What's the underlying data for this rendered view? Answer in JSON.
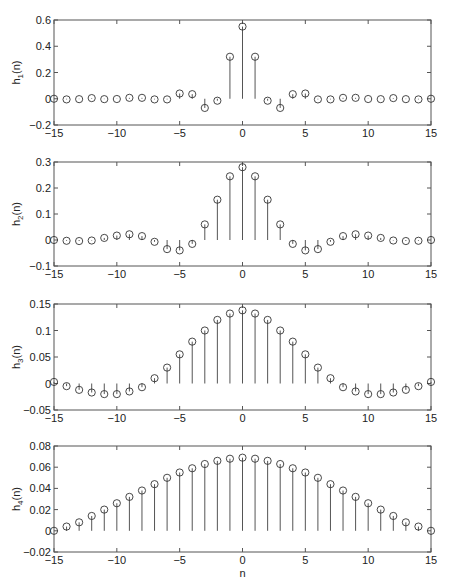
{
  "chart_data": [
    {
      "type": "stem",
      "ylabel": "h_1(n)",
      "ylabel_main": "h",
      "ylabel_sub": "1",
      "ylabel_tail": "(n)",
      "xlabel": "",
      "xlim": [
        -15,
        15
      ],
      "ylim": [
        -0.2,
        0.6
      ],
      "xticks": [
        -15,
        -10,
        -5,
        0,
        5,
        10,
        15
      ],
      "xtick_labels": [
        "−15",
        "−10",
        "−5",
        "0",
        "5",
        "10",
        "15"
      ],
      "yticks": [
        -0.2,
        0,
        0.2,
        0.4,
        0.6
      ],
      "ytick_labels": [
        "−0.2",
        "0",
        "0.2",
        "0.4",
        "0.6"
      ],
      "x": [
        -15,
        -14,
        -13,
        -12,
        -11,
        -10,
        -9,
        -8,
        -7,
        -6,
        -5,
        -4,
        -3,
        -2,
        -1,
        0,
        1,
        2,
        3,
        4,
        5,
        6,
        7,
        8,
        9,
        10,
        11,
        12,
        13,
        14,
        15
      ],
      "values": [
        0,
        -0.005,
        -0.003,
        0.005,
        -0.003,
        -0.002,
        0.007,
        0.007,
        -0.005,
        -0.005,
        0.04,
        0.035,
        -0.07,
        -0.015,
        0.32,
        0.55,
        0.32,
        -0.015,
        -0.07,
        0.035,
        0.04,
        -0.005,
        -0.005,
        0.007,
        0.007,
        -0.002,
        -0.003,
        0.005,
        -0.003,
        -0.005,
        0
      ]
    },
    {
      "type": "stem",
      "ylabel": "h_2(n)",
      "ylabel_main": "h",
      "ylabel_sub": "2",
      "ylabel_tail": "(n)",
      "xlabel": "",
      "xlim": [
        -15,
        15
      ],
      "ylim": [
        -0.1,
        0.3
      ],
      "xticks": [
        -15,
        -10,
        -5,
        0,
        5,
        10,
        15
      ],
      "xtick_labels": [
        "−15",
        "−10",
        "−5",
        "0",
        "5",
        "10",
        "15"
      ],
      "yticks": [
        -0.1,
        0,
        0.1,
        0.2,
        0.3
      ],
      "ytick_labels": [
        "−0.1",
        "0",
        "0.1",
        "0.2",
        "0.3"
      ],
      "x": [
        -15,
        -14,
        -13,
        -12,
        -11,
        -10,
        -9,
        -8,
        -7,
        -6,
        -5,
        -4,
        -3,
        -2,
        -1,
        0,
        1,
        2,
        3,
        4,
        5,
        6,
        7,
        8,
        9,
        10,
        11,
        12,
        13,
        14,
        15
      ],
      "values": [
        0,
        -0.003,
        -0.004,
        -0.002,
        0.008,
        0.017,
        0.022,
        0.015,
        -0.007,
        -0.035,
        -0.04,
        -0.015,
        0.06,
        0.155,
        0.245,
        0.28,
        0.245,
        0.155,
        0.06,
        -0.015,
        -0.04,
        -0.035,
        -0.007,
        0.015,
        0.022,
        0.017,
        0.008,
        -0.002,
        -0.004,
        -0.003,
        0
      ]
    },
    {
      "type": "stem",
      "ylabel": "h_3(n)",
      "ylabel_main": "h",
      "ylabel_sub": "3",
      "ylabel_tail": "(n)",
      "xlabel": "",
      "xlim": [
        -15,
        15
      ],
      "ylim": [
        -0.05,
        0.15
      ],
      "xticks": [
        -15,
        -10,
        -5,
        0,
        5,
        10,
        15
      ],
      "xtick_labels": [
        "−15",
        "−10",
        "−5",
        "0",
        "5",
        "10",
        "15"
      ],
      "yticks": [
        -0.05,
        0,
        0.05,
        0.1,
        0.15
      ],
      "ytick_labels": [
        "−0.05",
        "0",
        "0.05",
        "0.1",
        "0.15"
      ],
      "x": [
        -15,
        -14,
        -13,
        -12,
        -11,
        -10,
        -9,
        -8,
        -7,
        -6,
        -5,
        -4,
        -3,
        -2,
        -1,
        0,
        1,
        2,
        3,
        4,
        5,
        6,
        7,
        8,
        9,
        10,
        11,
        12,
        13,
        14,
        15
      ],
      "values": [
        0.003,
        -0.005,
        -0.012,
        -0.017,
        -0.02,
        -0.02,
        -0.015,
        -0.007,
        0.01,
        0.03,
        0.055,
        0.079,
        0.1,
        0.12,
        0.132,
        0.138,
        0.132,
        0.12,
        0.1,
        0.079,
        0.055,
        0.03,
        0.01,
        -0.007,
        -0.015,
        -0.02,
        -0.02,
        -0.017,
        -0.012,
        -0.005,
        0.003
      ]
    },
    {
      "type": "stem",
      "ylabel": "h_4(n)",
      "ylabel_main": "h",
      "ylabel_sub": "4",
      "ylabel_tail": "(n)",
      "xlabel": "n",
      "xlim": [
        -15,
        15
      ],
      "ylim": [
        -0.02,
        0.08
      ],
      "xticks": [
        -15,
        -10,
        -5,
        0,
        5,
        10,
        15
      ],
      "xtick_labels": [
        "−15",
        "−10",
        "−5",
        "0",
        "5",
        "10",
        "15"
      ],
      "yticks": [
        -0.02,
        0,
        0.02,
        0.04,
        0.06,
        0.08
      ],
      "ytick_labels": [
        "−0.02",
        "0",
        "0.02",
        "0.04",
        "0.06",
        "0.08"
      ],
      "x": [
        -15,
        -14,
        -13,
        -12,
        -11,
        -10,
        -9,
        -8,
        -7,
        -6,
        -5,
        -4,
        -3,
        -2,
        -1,
        0,
        1,
        2,
        3,
        4,
        5,
        6,
        7,
        8,
        9,
        10,
        11,
        12,
        13,
        14,
        15
      ],
      "values": [
        0,
        0.004,
        0.008,
        0.014,
        0.02,
        0.026,
        0.032,
        0.038,
        0.044,
        0.05,
        0.055,
        0.059,
        0.063,
        0.066,
        0.068,
        0.069,
        0.068,
        0.066,
        0.063,
        0.059,
        0.055,
        0.05,
        0.044,
        0.038,
        0.032,
        0.026,
        0.02,
        0.014,
        0.008,
        0.004,
        0
      ]
    }
  ]
}
